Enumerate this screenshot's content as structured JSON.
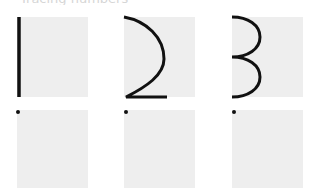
{
  "worksheet": {
    "header_fragment": "Tracing numbers",
    "colors": {
      "box_fill": "#eeeeee",
      "stroke": "#111111",
      "background": "#ffffff"
    },
    "trace_row": [
      {
        "numeral": "1",
        "glyph": "vertical-line"
      },
      {
        "numeral": "2",
        "glyph": "curve-two"
      },
      {
        "numeral": "3",
        "glyph": "double-curve-three"
      }
    ],
    "practice_row": [
      {
        "start_dot": true
      },
      {
        "start_dot": true
      },
      {
        "start_dot": true
      }
    ]
  }
}
